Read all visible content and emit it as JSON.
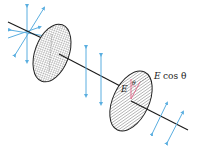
{
  "figure": {
    "labels": {
      "E": "E",
      "theta": "θ",
      "E_cos_theta_E": "E",
      "E_cos_theta_rest": "cos θ"
    },
    "colors": {
      "wave_arrows": "#5aaee0",
      "axis_line": "#1a1a1a",
      "disk_outline": "#222222",
      "hatch": "#555555",
      "angle_marker": "#e07090"
    }
  }
}
